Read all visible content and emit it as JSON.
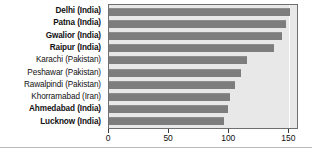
{
  "chart_data": {
    "type": "bar",
    "orientation": "horizontal",
    "title": "",
    "subtitle": "",
    "xlabel": "",
    "ylabel": "",
    "xlim": [
      0,
      158
    ],
    "xticks": [
      0,
      50,
      100,
      150
    ],
    "xtick_labels": [
      "0",
      "50",
      "100",
      "150"
    ],
    "grid": false,
    "legend": "none",
    "bar_color": "#7d7d7d",
    "plot_background": "#e8e8e8",
    "axis_color": "#6f6f6f",
    "categories": [
      "Delhi (India)",
      "Patna (India)",
      "Gwalior (India)",
      "Raipur (India)",
      "Karachi (Pakistan)",
      "Peshawar (Pakistan)",
      "Rawalpindi (Pakistan)",
      "Khorramabad (Iran)",
      "Ahmedabad (India)",
      "Lucknow (India)"
    ],
    "values": [
      152,
      149,
      145,
      139,
      116,
      111,
      106,
      102,
      100,
      97
    ],
    "emphasis": [
      true,
      true,
      true,
      true,
      false,
      false,
      false,
      false,
      true,
      true
    ]
  }
}
